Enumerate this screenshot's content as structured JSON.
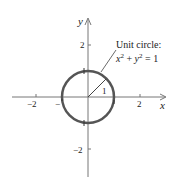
{
  "diagram": {
    "type": "unit-circle-plot",
    "axes": {
      "x_label": "x",
      "y_label": "y",
      "x_ticks": [
        {
          "value": -2,
          "label": "−2"
        },
        {
          "value": -1,
          "label": "−"
        },
        {
          "value": 2,
          "label": "2"
        }
      ],
      "y_ticks": [
        {
          "value": 2,
          "label": "2"
        },
        {
          "value": -2,
          "label": "−2"
        }
      ]
    },
    "circle": {
      "radius": 1,
      "color": "#555555"
    },
    "radius_label": "1",
    "annotation": {
      "line1": "Unit circle:",
      "equation_x": "x",
      "equation_sup1": "2",
      "equation_plus": " + ",
      "equation_y": "y",
      "equation_sup2": "2",
      "equation_rhs": " = 1"
    }
  }
}
